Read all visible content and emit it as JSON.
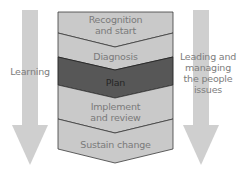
{
  "diagram": {
    "type": "process-flow",
    "colors": {
      "band_fill": "#c9c9c9",
      "band_stroke": "#3a3a3a",
      "highlight_fill": "#575757",
      "arrow_fill": "#cfcfcf",
      "text": "#7a7a7a",
      "highlight_text": "#262626"
    },
    "stages": [
      {
        "label_line1": "Recognition",
        "label_line2": "and start",
        "highlighted": false
      },
      {
        "label_line1": "Diagnosis",
        "label_line2": "",
        "highlighted": false
      },
      {
        "label_line1": "Plan",
        "label_line2": "",
        "highlighted": true
      },
      {
        "label_line1": "Implement",
        "label_line2": "and review",
        "highlighted": false
      },
      {
        "label_line1": "Sustain change",
        "label_line2": "",
        "highlighted": false
      }
    ],
    "left_arrow": {
      "label": "Learning"
    },
    "right_arrow": {
      "label_line1": "Leading and",
      "label_line2": "managing",
      "label_line3": "the people",
      "label_line4": "issues"
    }
  }
}
